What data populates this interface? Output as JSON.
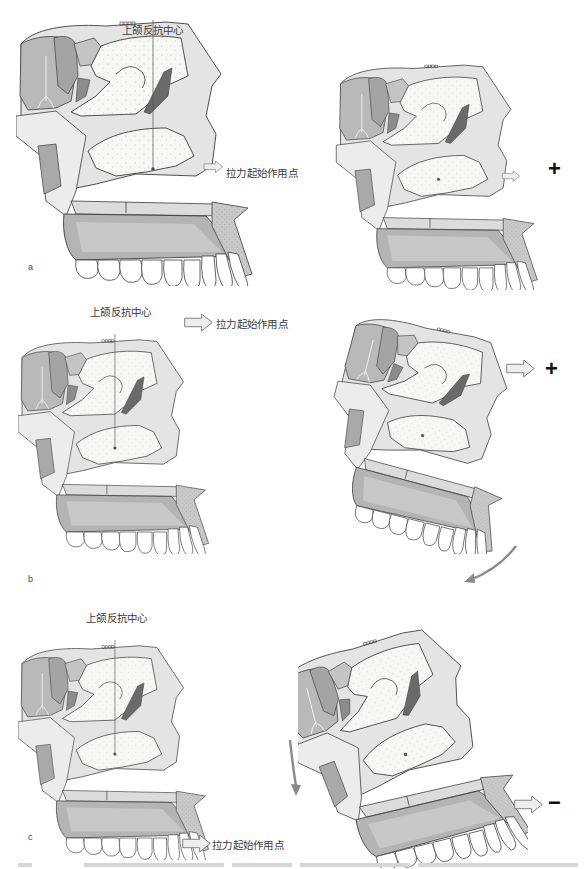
{
  "figure": {
    "panels": [
      {
        "id": "a",
        "letter": "a",
        "left": {
          "center_label": "上颌反抗中心",
          "force_label": "拉力起始作用点",
          "force_position": "below-center"
        },
        "right": {
          "sign": "+",
          "rotation": "none"
        }
      },
      {
        "id": "b",
        "letter": "b",
        "left": {
          "center_label": "上颌反抗中心",
          "force_label": "拉力起始作用点",
          "force_position": "above-center"
        },
        "right": {
          "sign": "+",
          "rotation": "counterclockwise",
          "rotation_arrow": "curved arrow near incisors pointing down-left"
        }
      },
      {
        "id": "c",
        "letter": "c",
        "left": {
          "center_label": "上颌反抗中心",
          "force_label": "拉力起始作用点",
          "force_position": "at-incisors"
        },
        "right": {
          "sign": "−",
          "rotation": "clockwise",
          "rotation_arrow": "curved arrow at posterior pointing down"
        }
      }
    ],
    "colors": {
      "bone_light": "#e6e6e6",
      "bone_mid": "#c8c8c8",
      "bone_dark": "#9a9a9a",
      "sinus_fill": "#f7f7f4",
      "outline": "#3c3c3c",
      "arrow_fill": "#eeeeee",
      "rotation_arrow": "#8a8a8a",
      "text": "#3a3a3a"
    },
    "caption_note": "caption cut off at bottom edge"
  }
}
